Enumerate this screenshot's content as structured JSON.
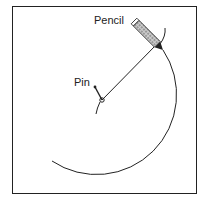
{
  "labels": {
    "pencil": "Pencil",
    "pin": "Pin"
  },
  "colors": {
    "stroke": "#222222",
    "pencil_fill": "#888888",
    "background": "#ffffff"
  }
}
